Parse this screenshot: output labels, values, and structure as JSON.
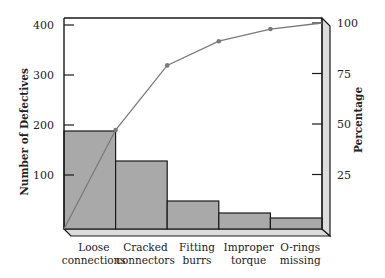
{
  "chart_data": {
    "type": "pareto",
    "title": "",
    "categories": [
      [
        "Loose",
        "connections"
      ],
      [
        "Cracked",
        "connectors"
      ],
      [
        "Fitting",
        "burrs"
      ],
      [
        "Improper",
        "torque"
      ],
      [
        "O-rings",
        "missing"
      ]
    ],
    "series": [
      {
        "name": "Number of Defectives",
        "type": "bar",
        "axis": "left",
        "values": [
          188,
          128,
          48,
          24,
          14
        ]
      },
      {
        "name": "Cumulative Percentage",
        "type": "line",
        "axis": "right",
        "values": [
          47,
          79,
          91,
          97,
          100
        ]
      }
    ],
    "ylabel": "Number of Defectives",
    "ylabel_right": "Percentage",
    "xlabel": "",
    "ylim": [
      0,
      410
    ],
    "ylim_right": [
      0,
      102
    ],
    "yticks": [
      100,
      200,
      300,
      400
    ],
    "yticks_right": [
      25,
      50,
      75,
      100
    ],
    "grid": false,
    "legend": "none",
    "style": {
      "bar_fill": "#a9a9a9",
      "bar_stroke": "#1a1a1a",
      "line_color": "#7a7a7a",
      "panel_fill": "#dcdcdc",
      "axis_color": "#1a1a1a"
    }
  }
}
